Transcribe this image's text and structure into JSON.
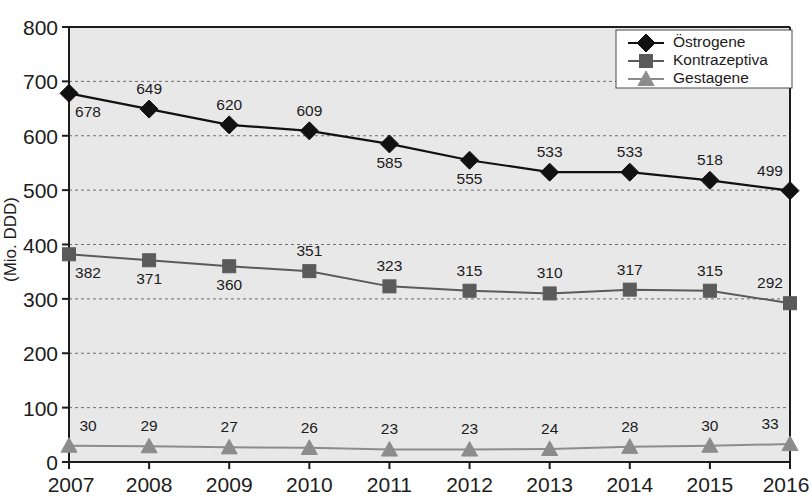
{
  "chart_data": {
    "type": "line",
    "title": "",
    "xlabel": "",
    "ylabel": "(Mio. DDD)",
    "categories": [
      "2007",
      "2008",
      "2009",
      "2010",
      "2011",
      "2012",
      "2013",
      "2014",
      "2015",
      "2016"
    ],
    "x": [
      2007,
      2008,
      2009,
      2010,
      2011,
      2012,
      2013,
      2014,
      2015,
      2016
    ],
    "ylim": [
      0,
      800
    ],
    "xlim": [
      2007,
      2016
    ],
    "yticks": [
      0,
      100,
      200,
      300,
      400,
      500,
      600,
      700,
      800
    ],
    "ytick_labels": [
      "0",
      "100",
      "200",
      "300",
      "400",
      "500",
      "600",
      "700",
      "800"
    ],
    "grid": true,
    "grid_axis": "y",
    "legend_position": "top-right",
    "plot_background": "#e8e8e8",
    "series": [
      {
        "name": "Östrogene",
        "marker": "diamond",
        "color": "#111111",
        "line_color": "#111111",
        "values": [
          678,
          649,
          620,
          609,
          585,
          555,
          533,
          533,
          518,
          499
        ],
        "label_positions": [
          "below",
          "above",
          "above",
          "above",
          "below",
          "below",
          "above",
          "above",
          "above",
          "above"
        ]
      },
      {
        "name": "Kontrazeptiva",
        "marker": "square",
        "color": "#5a5a5a",
        "line_color": "#5a5a5a",
        "values": [
          382,
          371,
          360,
          351,
          323,
          315,
          310,
          317,
          315,
          292
        ],
        "label_positions": [
          "below",
          "below",
          "below",
          "above",
          "above",
          "above",
          "above",
          "above",
          "above",
          "above"
        ]
      },
      {
        "name": "Gestagene",
        "marker": "triangle",
        "color": "#8c8c8c",
        "line_color": "#8c8c8c",
        "values": [
          30,
          29,
          27,
          26,
          23,
          23,
          24,
          28,
          30,
          33
        ],
        "label_positions": [
          "above",
          "above",
          "above",
          "above",
          "above",
          "above",
          "above",
          "above",
          "above",
          "above"
        ]
      }
    ]
  },
  "legend": {
    "entries": [
      {
        "label": "Östrogene"
      },
      {
        "label": "Kontrazeptiva"
      },
      {
        "label": "Gestagene"
      }
    ]
  },
  "axes": {
    "y_title": "(Mio. DDD)"
  }
}
